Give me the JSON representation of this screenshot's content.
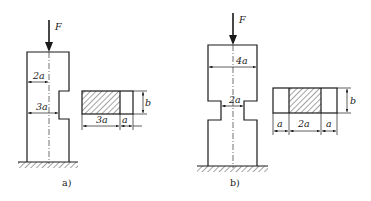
{
  "figure_a": {
    "force_label": "F",
    "dim_top": "2a",
    "dim_notch": "3a",
    "section": {
      "dim_hatched": "3a",
      "dim_unhatched": "a",
      "dim_height": "b"
    },
    "caption": "a)"
  },
  "figure_b": {
    "force_label": "F",
    "dim_top": "4a",
    "dim_neck": "2a",
    "section": {
      "dim_left": "a",
      "dim_middle": "2a",
      "dim_right": "a",
      "dim_height": "b"
    },
    "caption": "b)"
  },
  "colors": {
    "line": "#1a1a1a",
    "background": "#ffffff"
  }
}
